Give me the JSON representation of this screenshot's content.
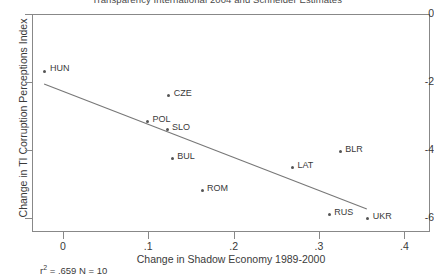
{
  "chart_data": {
    "type": "scatter",
    "title": "Transparency International 2004 and Schneider Estimates",
    "xlabel": "Change in Shadow Economy 1989-2000",
    "ylabel": "Change in TI Corruption Perceptions Index",
    "xlim": [
      -0.035,
      0.43
    ],
    "ylim": [
      -6.42,
      0.0
    ],
    "xticks": [
      0,
      0.1,
      0.2,
      0.3,
      0.4
    ],
    "xticklabels": [
      "0",
      ".1",
      ".2",
      ".3",
      ".4"
    ],
    "yticks": [
      0,
      -2,
      -4,
      -6
    ],
    "yticklabels": [
      "0",
      "-2",
      "-4",
      "-6"
    ],
    "grid": false,
    "legend": null,
    "caption": "r² = .659 N = 10",
    "caption_r2_value": ".659",
    "caption_n_value": "10",
    "points": [
      {
        "label": "HUN",
        "x": -0.021,
        "y": -1.68,
        "label_dx": 5,
        "label_dy": -4
      },
      {
        "label": "CZE",
        "x": 0.124,
        "y": -2.41,
        "label_dx": 5,
        "label_dy": -4
      },
      {
        "label": "POL",
        "x": 0.099,
        "y": -3.18,
        "label_dx": 5,
        "label_dy": -4
      },
      {
        "label": "SLO",
        "x": 0.122,
        "y": -3.41,
        "label_dx": 5,
        "label_dy": -4
      },
      {
        "label": "BUL",
        "x": 0.128,
        "y": -4.26,
        "label_dx": 5,
        "label_dy": -4
      },
      {
        "label": "ROM",
        "x": 0.163,
        "y": -5.21,
        "label_dx": 5,
        "label_dy": -4
      },
      {
        "label": "LAT",
        "x": 0.269,
        "y": -4.53,
        "label_dx": 5,
        "label_dy": -4
      },
      {
        "label": "BLR",
        "x": 0.325,
        "y": -4.06,
        "label_dx": 5,
        "label_dy": -4
      },
      {
        "label": "RUS",
        "x": 0.312,
        "y": -5.91,
        "label_dx": 5,
        "label_dy": -4
      },
      {
        "label": "UKR",
        "x": 0.357,
        "y": -6.03,
        "label_dx": 5,
        "label_dy": -4
      }
    ],
    "fit_line": {
      "x_start": -0.022,
      "y_start": -2.06,
      "x_end": 0.356,
      "y_end": -5.74,
      "r_squared": 0.659,
      "n": 10
    }
  }
}
